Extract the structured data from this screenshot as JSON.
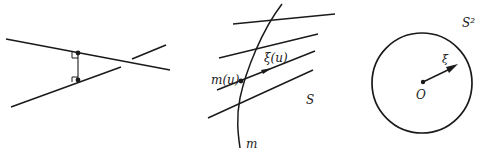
{
  "figure": {
    "colors": {
      "stroke": "#1a1a1a",
      "background": "#ffffff"
    },
    "panels": [
      {
        "id": "skew-lines",
        "description": "Two skew lines with their common perpendicular segment",
        "labels": []
      },
      {
        "id": "ruled-surface",
        "labels": {
          "point": "m(u)",
          "vector": "ξ(u)",
          "surface": "S",
          "curve": "m"
        }
      },
      {
        "id": "unit-sphere",
        "labels": {
          "sphere": "S²",
          "vector": "ξ",
          "center": "O"
        }
      }
    ]
  }
}
